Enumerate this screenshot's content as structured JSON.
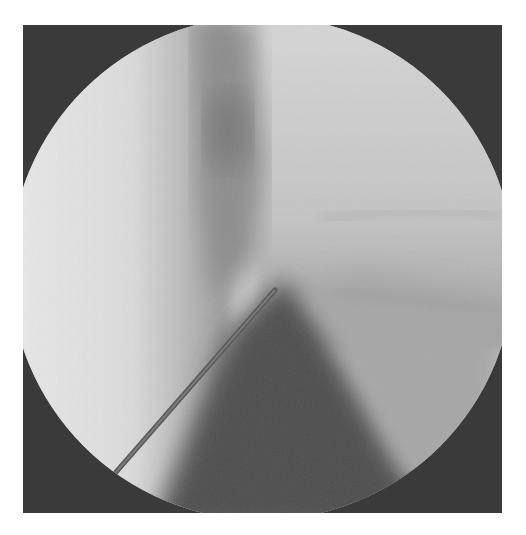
{
  "image": {
    "kind": "fluoroscopy-xray",
    "description": "Circular fluoroscopic field of view showing a needle inserted diagonally from lower-left toward center",
    "frame": {
      "x": 23,
      "y": 25,
      "width": 479,
      "height": 488
    },
    "field_of_view": {
      "shape": "circle",
      "cx": 262,
      "cy": 268,
      "r": 252
    },
    "needle": {
      "x1": 103,
      "y1": 487,
      "x2": 275,
      "y2": 290
    },
    "colors": {
      "background": "#ffffff",
      "collimator": "#3a3a3a",
      "bright_tissue": "#e6e6e6",
      "mid_tissue": "#a8a8a8",
      "dark_tissue": "#4a4a4a",
      "needle": "#5a5a5a"
    }
  }
}
